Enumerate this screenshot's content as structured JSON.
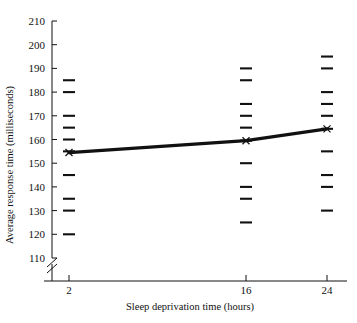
{
  "chart_data": {
    "type": "line",
    "title": "",
    "xlabel": "Sleep deprivation time (hours)",
    "ylabel": "Average response time (milliseconds)",
    "x": [
      2,
      16,
      24
    ],
    "xticklabels": [
      "2",
      "16",
      "24"
    ],
    "xlim": [
      0,
      26
    ],
    "ylim": [
      105,
      212
    ],
    "yticks": [
      110,
      120,
      130,
      140,
      150,
      160,
      170,
      180,
      190,
      200,
      210
    ],
    "yticklabels": [
      "110",
      "120",
      "130",
      "140",
      "150",
      "160",
      "170",
      "180",
      "190",
      "200",
      "210"
    ],
    "grid": false,
    "legend": null,
    "axis_break": true,
    "axis_break_note": "y-axis broken below 110",
    "series": [
      {
        "name": "Average response time",
        "values": [
          154.5,
          159.5,
          164.5
        ],
        "marker": "x",
        "color": "#111111"
      }
    ],
    "scatter_dashes": {
      "description": "individual observation tick marks (dashes) at each time point",
      "marker": "dash",
      "color": "#111111",
      "columns": [
        {
          "x": 2,
          "values": [
            185,
            180,
            170,
            165,
            160,
            155,
            145,
            135,
            130,
            120
          ]
        },
        {
          "x": 16,
          "values": [
            190,
            185,
            175,
            170,
            165,
            159.5,
            150,
            140,
            135,
            125
          ]
        },
        {
          "x": 24,
          "values": [
            195,
            190,
            180,
            175,
            170,
            164.5,
            155,
            145,
            140,
            130
          ]
        }
      ]
    }
  },
  "axes": {
    "y_title": "Average response time (milliseconds)",
    "x_title": "Sleep deprivation time (hours)"
  }
}
